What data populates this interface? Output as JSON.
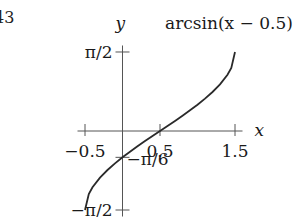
{
  "corner_fragment": "43",
  "chart_data": {
    "type": "line",
    "title": "",
    "function_label": "arcsin(x − 0.5)",
    "xlabel": "x",
    "ylabel": "y",
    "x_ticks": [
      {
        "value": -0.5,
        "label": "−0.5"
      },
      {
        "value": 0.5,
        "label": "0.5"
      },
      {
        "value": 1.5,
        "label": "1.5"
      }
    ],
    "y_ticks": [
      {
        "value": 1.5708,
        "label": "π/2"
      },
      {
        "value": -0.5236,
        "label": "−π/6"
      },
      {
        "value": -1.5708,
        "label": "−π/2"
      }
    ],
    "xlim": [
      -0.6,
      1.6
    ],
    "ylim": [
      -1.75,
      1.65
    ],
    "grid": false,
    "legend": "none",
    "series": [
      {
        "name": "arcsin(x − 0.5)",
        "x": [
          -0.5,
          -0.45,
          -0.4,
          -0.3,
          -0.2,
          -0.1,
          0.0,
          0.1,
          0.2,
          0.3,
          0.4,
          0.5,
          0.6,
          0.7,
          0.8,
          0.9,
          1.0,
          1.1,
          1.2,
          1.3,
          1.4,
          1.45,
          1.5
        ],
        "values": [
          -1.5708,
          -1.2532,
          -1.1198,
          -0.9273,
          -0.7754,
          -0.6435,
          -0.5236,
          -0.4115,
          -0.3047,
          -0.2014,
          -0.1002,
          0.0,
          0.1002,
          0.2014,
          0.3047,
          0.4115,
          0.5236,
          0.6435,
          0.7754,
          0.9273,
          1.1198,
          1.2532,
          1.5708
        ]
      }
    ]
  }
}
